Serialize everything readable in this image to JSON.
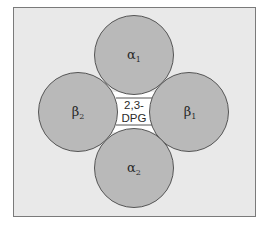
{
  "diagram": {
    "type": "hemoglobin-subunit-schematic",
    "colors": {
      "background": "#ffffff",
      "frame_fill": "#e9e9e9",
      "frame_border": "#7a7a7a",
      "subunit_fill": "#b9b9b9",
      "subunit_stroke": "#555555",
      "center_fill": "#ffffff"
    },
    "subunits": [
      {
        "id": "alpha1",
        "symbol": "α",
        "subscript": "1",
        "position": "top"
      },
      {
        "id": "beta1",
        "symbol": "β",
        "subscript": "1",
        "position": "right"
      },
      {
        "id": "alpha2",
        "symbol": "α",
        "subscript": "2",
        "position": "bottom"
      },
      {
        "id": "beta2",
        "symbol": "β",
        "subscript": "2",
        "position": "left"
      }
    ],
    "center": {
      "line1": "2,3-",
      "line2": "DPG"
    }
  }
}
